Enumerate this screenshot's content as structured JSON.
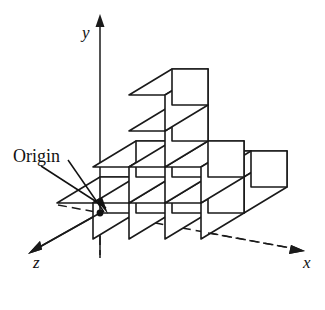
{
  "figure": {
    "type": "isometric-cube-diagram",
    "title": "",
    "background_color": "#ffffff",
    "line_color": "#1a1a1a",
    "annotation": {
      "origin_label": "Origin",
      "origin_point": {
        "x": 100,
        "y": 213,
        "marker": "filled-dot"
      },
      "leader_line": "arrow from label to origin point"
    },
    "axes": [
      {
        "name": "y-axis",
        "label": "y",
        "style": "solid",
        "direction": "up",
        "arrow": true,
        "label_x": 84,
        "label_y": 36
      },
      {
        "name": "x-axis",
        "label": "x",
        "style": "dashed",
        "direction": "right-down",
        "arrow": true,
        "label_x": 307,
        "label_y": 262
      },
      {
        "name": "z-axis",
        "label": "z",
        "style": "solid",
        "direction": "down-left",
        "arrow": true,
        "label_x": 40,
        "label_y": 253
      }
    ],
    "projection": {
      "cube_size_px": 36,
      "x_vector": [
        36,
        0
      ],
      "y_vector": [
        0,
        -36
      ],
      "z_vector": [
        -43,
        26
      ],
      "origin_screen": [
        100,
        213
      ]
    },
    "blocks": [
      {
        "id": "b-0-0-0",
        "gx": 0,
        "gy": 0,
        "gz": 0
      },
      {
        "id": "b-1-0-0",
        "gx": 1,
        "gy": 0,
        "gz": 0
      },
      {
        "id": "b-2-0-0",
        "gx": 2,
        "gy": 0,
        "gz": 0
      },
      {
        "id": "b-3-0-0",
        "gx": 3,
        "gy": 0,
        "gz": 0
      },
      {
        "id": "b-1-0-1",
        "gx": 1,
        "gy": 0,
        "gz": -1
      },
      {
        "id": "b-2-0-1",
        "gx": 2,
        "gy": 0,
        "gz": -1
      },
      {
        "id": "b-3-0-1",
        "gx": 3,
        "gy": 0,
        "gz": -1
      },
      {
        "id": "b-1-1-0",
        "gx": 1,
        "gy": 1,
        "gz": 0
      },
      {
        "id": "b-2-1-0",
        "gx": 2,
        "gy": 1,
        "gz": 0
      },
      {
        "id": "b-3-1-0",
        "gx": 3,
        "gy": 1,
        "gz": 0
      },
      {
        "id": "b-2-2-0",
        "gx": 2,
        "gy": 2,
        "gz": 0
      },
      {
        "id": "b-2-3-0",
        "gx": 2,
        "gy": 3,
        "gz": 0
      }
    ],
    "cube_count": 12
  }
}
